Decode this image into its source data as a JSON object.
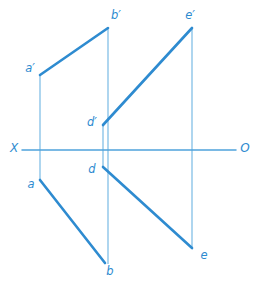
{
  "figure": {
    "width": 265,
    "height": 293,
    "background": "#ffffff"
  },
  "colors": {
    "segment_stroke": "#2E8BD0",
    "projector_stroke": "#8CC4E8",
    "axis_stroke": "#4FA3DC",
    "label_fill": "#2E8BD0"
  },
  "axis": {
    "name": "ground-line",
    "left_label": "X",
    "right_label": "O",
    "y": 150,
    "x_start": 22,
    "x_end": 236,
    "left_label_pos": {
      "x": 14,
      "y": 148
    },
    "right_label_pos": {
      "x": 245,
      "y": 148
    }
  },
  "points": [
    {
      "id": "a_prime",
      "label": "a′",
      "x": 40,
      "y": 75,
      "label_x": 30,
      "label_y": 68,
      "view": "frontal"
    },
    {
      "id": "b_prime",
      "label": "b′",
      "x": 108,
      "y": 28,
      "label_x": 116,
      "label_y": 15,
      "view": "frontal"
    },
    {
      "id": "d_prime",
      "label": "d′",
      "x": 103,
      "y": 125,
      "label_x": 92,
      "label_y": 122,
      "view": "frontal"
    },
    {
      "id": "e_prime",
      "label": "e′",
      "x": 192,
      "y": 28,
      "label_x": 190,
      "label_y": 15,
      "view": "frontal"
    },
    {
      "id": "a",
      "label": "a",
      "x": 40,
      "y": 180,
      "label_x": 31,
      "label_y": 184,
      "view": "horizontal"
    },
    {
      "id": "b",
      "label": "b",
      "x": 105,
      "y": 263,
      "label_x": 110,
      "label_y": 271,
      "view": "horizontal"
    },
    {
      "id": "d",
      "label": "d",
      "x": 103,
      "y": 167,
      "label_x": 92,
      "label_y": 169,
      "view": "horizontal"
    },
    {
      "id": "e",
      "label": "e",
      "x": 192,
      "y": 248,
      "label_x": 204,
      "label_y": 255,
      "view": "horizontal"
    }
  ],
  "segments": [
    {
      "id": "seg-ab-frontal",
      "from": "a_prime",
      "to": "b_prime",
      "x1": 40,
      "y1": 75,
      "x2": 108,
      "y2": 28,
      "weight": "thick"
    },
    {
      "id": "seg-de-frontal",
      "from": "d_prime",
      "to": "e_prime",
      "x1": 103,
      "y1": 125,
      "x2": 192,
      "y2": 28,
      "weight": "thick"
    },
    {
      "id": "seg-ab-horizontal",
      "from": "a",
      "to": "b",
      "x1": 40,
      "y1": 180,
      "x2": 105,
      "y2": 263,
      "weight": "thick"
    },
    {
      "id": "seg-de-horizontal",
      "from": "d",
      "to": "e",
      "x1": 103,
      "y1": 167,
      "x2": 192,
      "y2": 248,
      "weight": "thick"
    }
  ],
  "projectors": [
    {
      "id": "projector-a",
      "x": 40,
      "y1": 75,
      "y2": 180
    },
    {
      "id": "projector-b",
      "x": 108,
      "y1": 28,
      "y2": 264
    },
    {
      "id": "projector-d",
      "x": 103,
      "y1": 125,
      "y2": 168
    },
    {
      "id": "projector-e",
      "x": 192,
      "y1": 28,
      "y2": 248
    }
  ]
}
